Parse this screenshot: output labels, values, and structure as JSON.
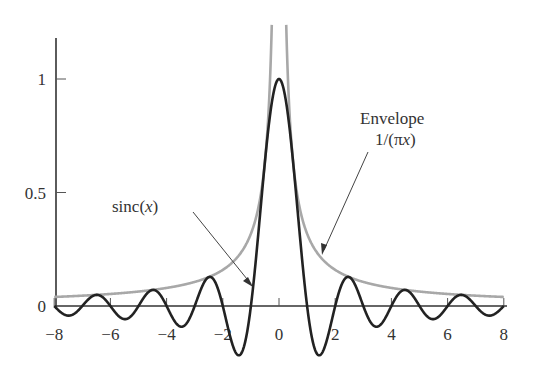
{
  "chart_data": {
    "type": "line",
    "title": "",
    "xlabel": "",
    "ylabel": "",
    "xlim": [
      -8,
      8
    ],
    "ylim": [
      -0.22,
      1.18
    ],
    "x_ticks": [
      -8,
      -6,
      -4,
      -2,
      0,
      2,
      4,
      6,
      8
    ],
    "x_tick_labels": [
      "−8",
      "−6",
      "−4",
      "−2",
      "0",
      "2",
      "4",
      "6",
      "8"
    ],
    "y_ticks": [
      0,
      0.5,
      1
    ],
    "y_tick_labels": [
      "0",
      "0.5",
      "1"
    ],
    "grid": false,
    "legend": "none",
    "series": [
      {
        "name": "sinc(x)",
        "formula": "sin(pi x)/(pi x)",
        "color": "#222222",
        "x": [
          -8,
          -7.5,
          -6.5,
          -5.5,
          -4.5,
          -3.5,
          -2.5,
          -1.43,
          -1,
          0,
          1,
          1.43,
          2.5,
          3.5,
          4.5,
          5.5,
          6.5,
          7.5,
          8
        ],
        "values": [
          0,
          -0.042,
          0.049,
          -0.058,
          0.071,
          -0.091,
          0.127,
          -0.217,
          0,
          1,
          0,
          -0.217,
          0.127,
          -0.091,
          0.071,
          -0.058,
          0.049,
          -0.042,
          0
        ]
      },
      {
        "name": "Envelope 1/(πx)",
        "formula": "1/(pi |x|)",
        "color": "#a8a8a8",
        "x": [
          -8,
          -6,
          -4,
          -2,
          -1,
          -0.5,
          -0.26,
          0.26,
          0.5,
          1,
          2,
          4,
          6,
          8
        ],
        "values": [
          0.04,
          0.053,
          0.08,
          0.159,
          0.318,
          0.637,
          1.22,
          1.22,
          0.637,
          0.318,
          0.159,
          0.08,
          0.053,
          0.04
        ]
      }
    ],
    "annotations": [
      {
        "text": "sinc(x)",
        "arrow_to": [
          -0.95,
          0.09
        ]
      },
      {
        "text_line1": "Envelope",
        "text_line2": "1/(πx)",
        "arrow_to": [
          1.55,
          0.23
        ]
      }
    ]
  },
  "labels": {
    "sinc_label_prefix": "sinc(",
    "sinc_label_var": "x",
    "sinc_label_suffix": ")",
    "envelope_line1": "Envelope",
    "envelope_line2_prefix": "1/(π",
    "envelope_line2_var": "x",
    "envelope_line2_suffix": ")"
  },
  "colors": {
    "sinc": "#222222",
    "envelope": "#a8a8a8",
    "axis": "#333333"
  }
}
